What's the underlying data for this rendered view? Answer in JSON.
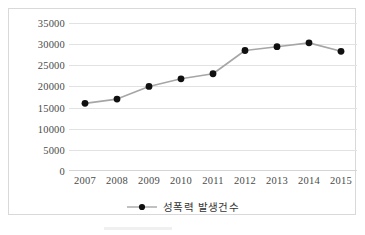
{
  "chart_data": {
    "type": "line",
    "title": "",
    "xlabel": "",
    "ylabel": "",
    "categories": [
      "2007",
      "2008",
      "2009",
      "2010",
      "2011",
      "2012",
      "2013",
      "2014",
      "2015"
    ],
    "series": [
      {
        "name": "성폭력 발생건수",
        "values": [
          16000,
          17000,
          20000,
          21800,
          23000,
          28500,
          29400,
          30300,
          28300
        ]
      }
    ],
    "ylim": [
      0,
      35000
    ],
    "yticks": [
      "0",
      "5000",
      "10000",
      "15000",
      "20000",
      "25000",
      "30000",
      "35000"
    ],
    "ytick_values": [
      0,
      5000,
      10000,
      15000,
      20000,
      25000,
      30000,
      35000
    ],
    "grid": true,
    "legend_position": "bottom",
    "colors": {
      "line": "#a6a6a6",
      "marker": "#101010",
      "gridline": "#e2e2e2",
      "frame": "#d9d9d9",
      "tick_label": "#4a4a4a",
      "legend_label": "#333333",
      "background": "#ffffff"
    }
  },
  "legend": {
    "entries": [
      {
        "label": "성폭력 발생건수",
        "marker": "filled-circle-with-line"
      }
    ]
  }
}
